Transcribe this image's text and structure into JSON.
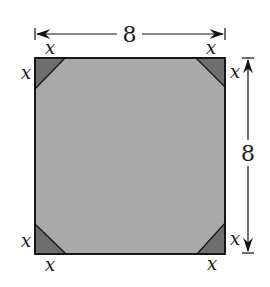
{
  "diagram": {
    "square": {
      "side_label_top": "8",
      "side_label_right": "8",
      "fill_color": "#a9a9a9",
      "corner_fill_color": "#6e6e6e",
      "stroke_color": "#111111"
    },
    "corner_labels": {
      "top_left_top": "x",
      "top_left_side": "x",
      "top_right_top": "x",
      "top_right_side": "x",
      "bottom_left_side": "x",
      "bottom_left_bottom": "x",
      "bottom_right_side": "x",
      "bottom_right_bottom": "x"
    }
  }
}
